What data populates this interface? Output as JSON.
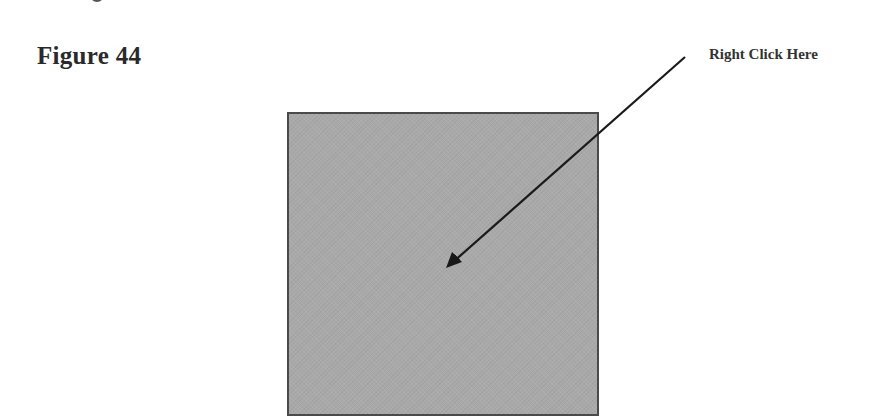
{
  "figure": {
    "title": "Figure 44",
    "callout_label": "Right Click Here"
  },
  "target": {
    "fill_color": "#a9a9a9",
    "border_color": "#4a4a4a"
  },
  "arrow": {
    "color": "#1a1a1a",
    "from": [
      685,
      57
    ],
    "to": [
      446,
      268
    ]
  }
}
